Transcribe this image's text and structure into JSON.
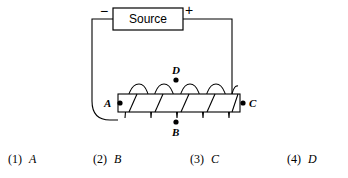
{
  "diagram": {
    "source_box": {
      "label": "Source"
    },
    "terminals": {
      "negative": "−",
      "positive": "+"
    },
    "points": [
      {
        "id": "A",
        "label": "A",
        "label_side": "left"
      },
      {
        "id": "B",
        "label": "B",
        "label_side": "below"
      },
      {
        "id": "C",
        "label": "C",
        "label_side": "right"
      },
      {
        "id": "D",
        "label": "D",
        "label_side": "above"
      }
    ],
    "colors": {
      "stroke": "#000000",
      "background": "#ffffff"
    },
    "coil_turns": 5
  },
  "choices": [
    {
      "number": "(1)",
      "value": "A"
    },
    {
      "number": "(2)",
      "value": "B"
    },
    {
      "number": "(3)",
      "value": "C"
    },
    {
      "number": "(4)",
      "value": "D"
    }
  ]
}
